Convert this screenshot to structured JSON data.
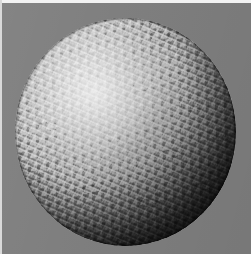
{
  "scene": {
    "title": "Rendered sphere with procedural wrinkle bump texture",
    "render_type": "3d-raster-render",
    "canvas": {
      "width_px": 251,
      "height_px": 254,
      "background_color": "#7d7d7d",
      "border_top_color": "#f2f2f2",
      "border_left_color": "#d9d9d9"
    },
    "object": {
      "name": "sphere",
      "shape": "sphere",
      "surface": "wrinkled / crumpled bump-mapped",
      "material_color": "#8d8d8d",
      "center_x_px": 125,
      "center_y_px": 132,
      "radius_px": 110,
      "bounds": {
        "left_px": 15,
        "top_px": 18,
        "right_px": 236,
        "bottom_px": 246
      }
    },
    "lighting": {
      "key_light_direction": "upper-left",
      "highlight_x_pct": 36,
      "highlight_y_pct": 33,
      "highlight_color": "#cfcfcf",
      "terminator_direction": "lower-right",
      "shadow_color": "#0d0d0d"
    }
  }
}
